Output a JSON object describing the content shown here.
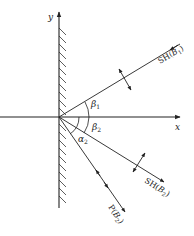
{
  "diagram": {
    "type": "wave reflection at free surface",
    "axes": {
      "x_label": "x",
      "y_label": "y"
    },
    "rays": [
      {
        "id": "incident",
        "label_main": "SH(",
        "label_var": "B",
        "label_sub": "1",
        "label_close": ")",
        "direction": "incoming"
      },
      {
        "id": "reflected_sh",
        "label_main": "SH(",
        "label_var": "B",
        "label_sub": "2",
        "label_close": ")",
        "direction": "outgoing"
      },
      {
        "id": "reflected_p",
        "label_main": "P(",
        "label_var": "B",
        "label_sub": "2",
        "label_close": ")",
        "direction": "outgoing"
      }
    ],
    "angles": [
      {
        "symbol": "β",
        "sub": "1"
      },
      {
        "symbol": "β",
        "sub": "2"
      },
      {
        "symbol": "α",
        "sub": "2"
      }
    ],
    "colors": {
      "line": "#222222",
      "background": "#ffffff"
    }
  }
}
